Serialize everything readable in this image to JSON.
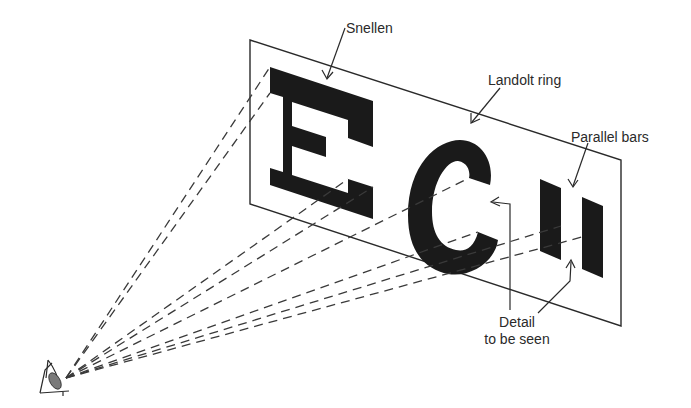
{
  "diagram": {
    "colors": {
      "ink": "#1a1a1a",
      "line": "#2a2a2a",
      "dash": "#3a3a3a",
      "background": "#ffffff"
    },
    "labels": {
      "snellen": "Snellen",
      "landolt": "Landolt ring",
      "parallel": "Parallel bars",
      "detail_line1": "Detail",
      "detail_line2": "to be seen"
    },
    "targets": [
      {
        "name": "Snellen E",
        "type": "snellen-letter"
      },
      {
        "name": "Landolt ring",
        "type": "landolt-c"
      },
      {
        "name": "Parallel bars",
        "type": "bar-pair"
      }
    ],
    "observer": {
      "name": "eye",
      "icon": "eye-icon"
    }
  }
}
